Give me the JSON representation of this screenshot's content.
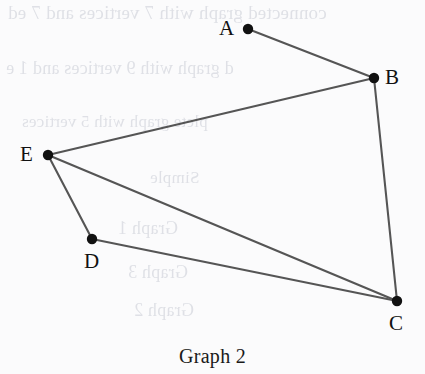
{
  "figure": {
    "caption": "Graph 2",
    "background_color": "#fbfbfc",
    "edge_color": "#555555",
    "vertex_color": "#111111",
    "label_color": "#111111"
  },
  "chart_data": {
    "type": "diagram",
    "title": "Graph 2",
    "diagram_kind": "undirected-graph",
    "vertex_count": 5,
    "edge_count": 6,
    "vertices": [
      {
        "id": "A",
        "label": "A",
        "x": 248,
        "y": 29,
        "label_x": 219,
        "label_y": 18,
        "label_side": "left"
      },
      {
        "id": "B",
        "label": "B",
        "x": 374,
        "y": 78,
        "label_x": 385,
        "label_y": 67,
        "label_side": "right"
      },
      {
        "id": "C",
        "label": "C",
        "x": 397,
        "y": 301,
        "label_x": 389,
        "label_y": 313,
        "label_side": "below"
      },
      {
        "id": "D",
        "label": "D",
        "x": 92,
        "y": 239,
        "label_x": 84,
        "label_y": 251,
        "label_side": "below"
      },
      {
        "id": "E",
        "label": "E",
        "x": 48,
        "y": 155,
        "label_x": 20,
        "label_y": 144,
        "label_side": "left"
      }
    ],
    "edges": [
      {
        "from": "A",
        "to": "B"
      },
      {
        "from": "B",
        "to": "E"
      },
      {
        "from": "B",
        "to": "C"
      },
      {
        "from": "E",
        "to": "D"
      },
      {
        "from": "E",
        "to": "C"
      },
      {
        "from": "D",
        "to": "C"
      }
    ],
    "adjacency": {
      "A": [
        "B"
      ],
      "B": [
        "A",
        "E",
        "C"
      ],
      "C": [
        "B",
        "E",
        "D"
      ],
      "D": [
        "E",
        "C"
      ],
      "E": [
        "B",
        "D",
        "C"
      ]
    },
    "degrees": {
      "A": 1,
      "B": 3,
      "C": 3,
      "D": 2,
      "E": 3
    },
    "xlabel": "",
    "ylabel": "",
    "grid": false,
    "legend": false
  },
  "bleed_through_text": [
    {
      "text": "connected graph with 7 vertices and 7 ed",
      "x": 8,
      "y": 2,
      "size": 19
    },
    {
      "text": "d graph with 9 vertices and 1 e",
      "x": 6,
      "y": 58,
      "size": 18
    },
    {
      "text": "plete graph with 5 vertices",
      "x": 22,
      "y": 112,
      "size": 17
    },
    {
      "text": "Simple",
      "x": 150,
      "y": 168,
      "size": 17
    },
    {
      "text": "Graph 1",
      "x": 118,
      "y": 218,
      "size": 18
    },
    {
      "text": "Graph 3",
      "x": 128,
      "y": 262,
      "size": 18
    },
    {
      "text": "Graph 2",
      "x": 134,
      "y": 300,
      "size": 18
    }
  ]
}
